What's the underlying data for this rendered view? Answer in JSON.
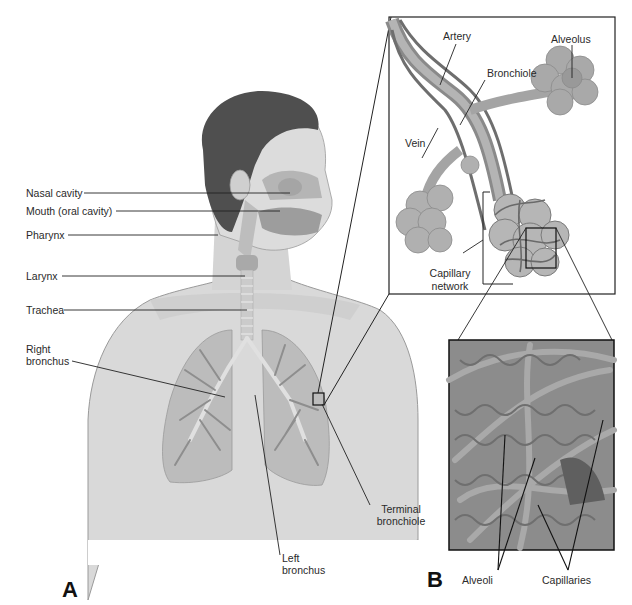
{
  "figure": {
    "panels": [
      {
        "id": "A",
        "label": "A",
        "description": "Human upper body showing respiratory tract"
      },
      {
        "id": "B",
        "label": "B",
        "description": "Bronchiole, alveoli and capillary network detail"
      }
    ]
  },
  "panel_a": {
    "letter": "A",
    "labels": {
      "nasal_cavity": "Nasal cavity",
      "mouth": "Mouth (oral cavity)",
      "pharynx": "Pharynx",
      "larynx": "Larynx",
      "trachea": "Trachea",
      "right_bronchus_1": "Right",
      "right_bronchus_2": "bronchus",
      "left_bronchus_1": "Left",
      "left_bronchus_2": "bronchus",
      "terminal_bronchiole_1": "Terminal",
      "terminal_bronchiole_2": "bronchiole"
    }
  },
  "panel_b": {
    "letter": "B",
    "labels": {
      "artery": "Artery",
      "alveolus": "Alveolus",
      "bronchiole": "Bronchiole",
      "vein": "Vein",
      "capillary_network_1": "Capillary",
      "capillary_network_2": "network",
      "alveoli": "Alveoli",
      "capillaries": "Capillaries"
    }
  },
  "colors": {
    "skin": "#d6d6d6",
    "skin_dark": "#c4c4c4",
    "hair": "#4a4a4a",
    "lung": "#b8b8b8",
    "lung_branch": "#8f8f8f",
    "vessel": "#7a7a7a",
    "alveolus": "#a8a8a8",
    "line": "#1a1a1a"
  }
}
